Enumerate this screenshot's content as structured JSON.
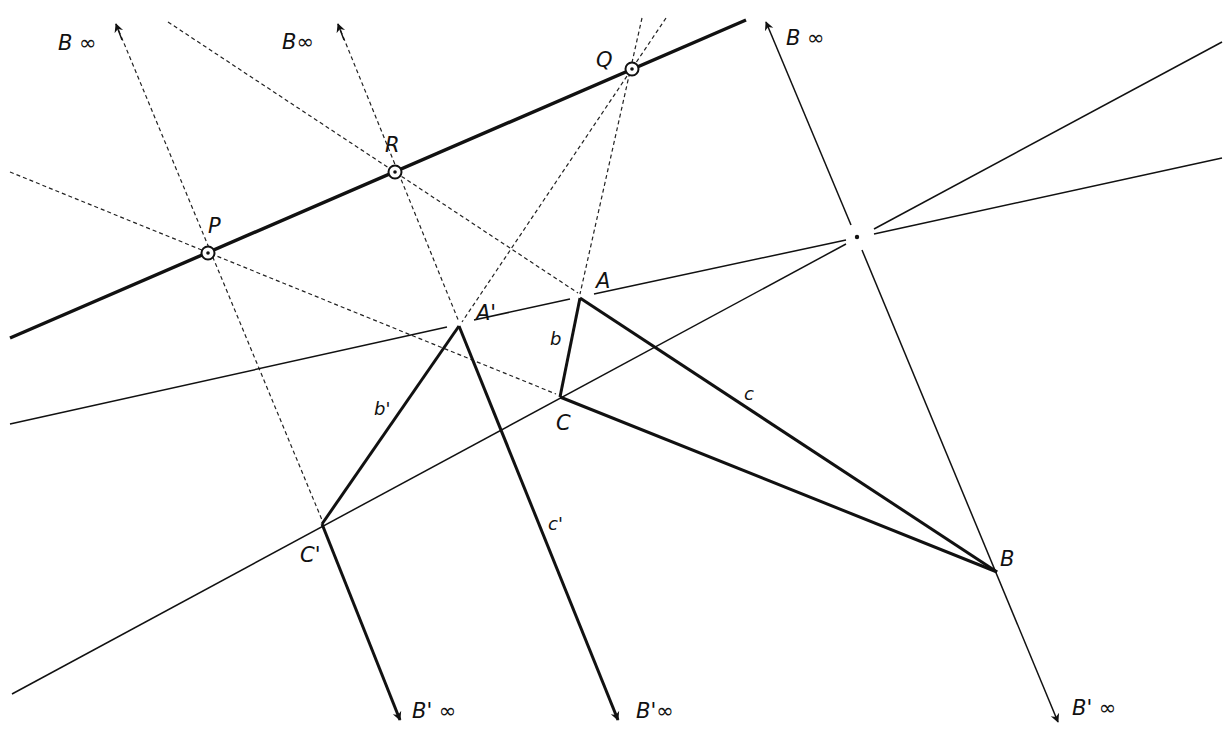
{
  "diagram": {
    "type": "projective-geometry-construction",
    "colors": {
      "ink": "#111111",
      "background": "#ffffff"
    },
    "points": {
      "P": {
        "label": "P",
        "x": 208,
        "y": 253
      },
      "R": {
        "label": "R",
        "x": 395,
        "y": 172
      },
      "Q": {
        "label": "Q",
        "x": 632,
        "y": 69
      },
      "A": {
        "label": "A",
        "x": 580,
        "y": 298
      },
      "A_prime": {
        "label": "A'",
        "x": 459,
        "y": 326
      },
      "C": {
        "label": "C",
        "x": 560,
        "y": 397
      },
      "C_prime": {
        "label": "C'",
        "x": 322,
        "y": 524
      },
      "B": {
        "label": "B",
        "x": 997,
        "y": 572
      },
      "O": {
        "label": "",
        "x": 857,
        "y": 237
      }
    },
    "segment_labels": {
      "b": "b",
      "c": "c",
      "b_prime": "b'",
      "c_prime": "c'"
    },
    "infinity_labels": {
      "B_inf_1": "B ∞",
      "B_inf_2": "B∞",
      "B_inf_3": "B ∞",
      "Bp_inf_1": "B' ∞",
      "Bp_inf_2": "B'∞",
      "Bp_inf_3": "B' ∞"
    }
  }
}
